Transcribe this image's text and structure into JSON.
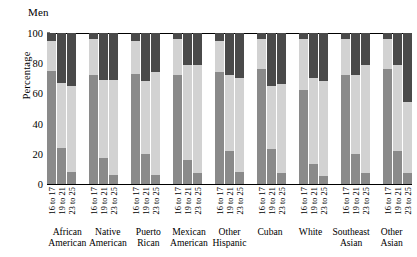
{
  "chart": {
    "title": "Men",
    "ylabel": "Percentage"
  },
  "chart_data": {
    "type": "bar",
    "subtype": "stacked-bar-100",
    "title": "Men",
    "xlabel": "",
    "ylabel": "Percentage",
    "ylim": [
      0,
      100
    ],
    "yticks": [
      0,
      20,
      40,
      60,
      80,
      100
    ],
    "grid": false,
    "legend": false,
    "colors": {
      "series1": "#8a8a8a",
      "series2": "#d2d2d2",
      "series3": "#4a4a4a",
      "axis": "#000000",
      "background": "#ffffff"
    },
    "series": [
      {
        "name": "Less than high school",
        "color": "#8a8a8a"
      },
      {
        "name": "High school graduate",
        "color": "#d2d2d2"
      },
      {
        "name": "Some college or more",
        "color": "#4a4a4a"
      }
    ],
    "categories": [
      "African American",
      "Native American",
      "Puerto Rican",
      "Mexican American",
      "Other Hispanic",
      "Cuban",
      "White",
      "Southeast Asian",
      "Other Asian"
    ],
    "subcategories": [
      "16 to 17",
      "19 to 21",
      "23 to 25"
    ],
    "groups": [
      {
        "category": "African American",
        "bars": [
          {
            "age": "16 to 17",
            "values": [
              75,
              20,
              5
            ]
          },
          {
            "age": "19 to 21",
            "values": [
              24,
              43,
              33
            ]
          },
          {
            "age": "23 to 25",
            "values": [
              8,
              57,
              35
            ]
          }
        ]
      },
      {
        "category": "Native American",
        "bars": [
          {
            "age": "16 to 17",
            "values": [
              72,
              24,
              4
            ]
          },
          {
            "age": "19 to 21",
            "values": [
              17,
              52,
              31
            ]
          },
          {
            "age": "23 to 25",
            "values": [
              6,
              63,
              31
            ]
          }
        ]
      },
      {
        "category": "Puerto Rican",
        "bars": [
          {
            "age": "16 to 17",
            "values": [
              73,
              22,
              5
            ]
          },
          {
            "age": "19 to 21",
            "values": [
              20,
              48,
              32
            ]
          },
          {
            "age": "23 to 25",
            "values": [
              6,
              68,
              26
            ]
          }
        ]
      },
      {
        "category": "Mexican American",
        "bars": [
          {
            "age": "16 to 17",
            "values": [
              72,
              24,
              4
            ]
          },
          {
            "age": "19 to 21",
            "values": [
              16,
              63,
              21
            ]
          },
          {
            "age": "23 to 25",
            "values": [
              7,
              72,
              21
            ]
          }
        ]
      },
      {
        "category": "Other Hispanic",
        "bars": [
          {
            "age": "16 to 17",
            "values": [
              74,
              21,
              5
            ]
          },
          {
            "age": "19 to 21",
            "values": [
              22,
              50,
              28
            ]
          },
          {
            "age": "23 to 25",
            "values": [
              8,
              62,
              30
            ]
          }
        ]
      },
      {
        "category": "Cuban",
        "bars": [
          {
            "age": "16 to 17",
            "values": [
              76,
              20,
              4
            ]
          },
          {
            "age": "19 to 21",
            "values": [
              23,
              42,
              35
            ]
          },
          {
            "age": "23 to 25",
            "values": [
              7,
              59,
              34
            ]
          }
        ]
      },
      {
        "category": "White",
        "bars": [
          {
            "age": "16 to 17",
            "values": [
              62,
              34,
              4
            ]
          },
          {
            "age": "19 to 21",
            "values": [
              13,
              57,
              30
            ]
          },
          {
            "age": "23 to 25",
            "values": [
              5,
              63,
              32
            ]
          }
        ]
      },
      {
        "category": "Southeast Asian",
        "bars": [
          {
            "age": "16 to 17",
            "values": [
              72,
              24,
              4
            ]
          },
          {
            "age": "19 to 21",
            "values": [
              20,
              52,
              28
            ]
          },
          {
            "age": "23 to 25",
            "values": [
              7,
              72,
              21
            ]
          }
        ]
      },
      {
        "category": "Other Asian",
        "bars": [
          {
            "age": "16 to 17",
            "values": [
              76,
              20,
              4
            ]
          },
          {
            "age": "19 to 21",
            "values": [
              22,
              57,
              21
            ]
          },
          {
            "age": "23 to 25",
            "values": [
              7,
              47,
              46
            ]
          }
        ]
      }
    ]
  },
  "labels": {
    "group_label_lines": [
      [
        "African",
        "American"
      ],
      [
        "Native",
        "American"
      ],
      [
        "Puerto",
        "Rican"
      ],
      [
        "Mexican",
        "American"
      ],
      [
        "Other",
        "Hispanic"
      ],
      [
        "Cuban",
        ""
      ],
      [
        "White",
        ""
      ],
      [
        "Southeast",
        "Asian"
      ],
      [
        "Other",
        "Asian"
      ]
    ]
  }
}
